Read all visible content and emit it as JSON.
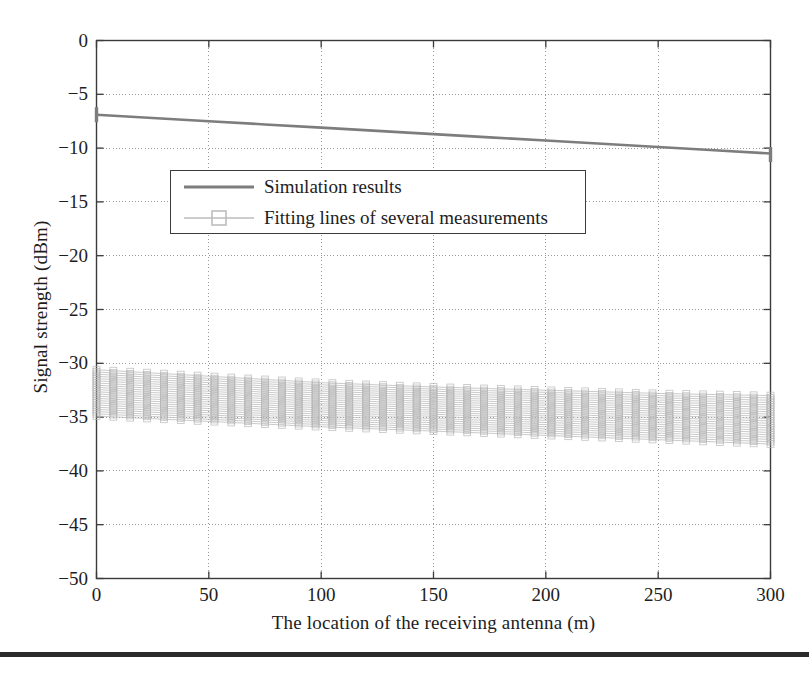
{
  "chart_data": {
    "type": "line",
    "title": "",
    "xlabel": "The location of the receiving antenna (m)",
    "ylabel": "Signal strength (dBm)",
    "xlim": [
      0,
      300
    ],
    "ylim": [
      -50,
      0
    ],
    "xticks": [
      0,
      50,
      100,
      150,
      200,
      250,
      300
    ],
    "yticks": [
      0,
      -5,
      -10,
      -15,
      -20,
      -25,
      -30,
      -35,
      -40,
      -45,
      -50
    ],
    "xtick_labels": [
      "0",
      "50",
      "100",
      "150",
      "200",
      "250",
      "300"
    ],
    "ytick_labels": [
      "0",
      "−5",
      "−10",
      "−15",
      "−20",
      "−25",
      "−30",
      "−35",
      "−40",
      "−45",
      "−50"
    ],
    "grid": true,
    "grid_style": "dotted",
    "legend_position": "upper-left-inset",
    "series": [
      {
        "name": "Simulation results",
        "style": "solid-line",
        "color": "#7d7d7d",
        "marker": "none",
        "x": [
          0,
          25,
          50,
          75,
          100,
          125,
          150,
          175,
          200,
          225,
          250,
          275,
          300
        ],
        "values": [
          -6.9,
          -7.2,
          -7.5,
          -7.8,
          -8.1,
          -8.4,
          -8.7,
          -9.0,
          -9.3,
          -9.6,
          -9.9,
          -10.2,
          -10.5
        ]
      },
      {
        "name": "Fitting lines of several measurements",
        "style": "line-with-square-markers",
        "color": "#b8b8b8",
        "marker": "square",
        "description": "A dense bundle of ~22 near-parallel fitting lines forming a band",
        "band_upper": {
          "x": [
            0,
            50,
            100,
            150,
            200,
            250,
            300
          ],
          "values": [
            -30.6,
            -31.2,
            -31.8,
            -32.2,
            -32.5,
            -32.8,
            -33.0
          ]
        },
        "band_lower": {
          "x": [
            0,
            50,
            100,
            150,
            200,
            250,
            300
          ],
          "values": [
            -34.9,
            -35.4,
            -35.9,
            -36.3,
            -36.7,
            -37.1,
            -37.5
          ]
        },
        "band_center": {
          "x": [
            0,
            50,
            100,
            150,
            200,
            250,
            300
          ],
          "values": [
            -32.7,
            -33.3,
            -33.8,
            -34.2,
            -34.6,
            -34.9,
            -35.2
          ]
        }
      }
    ]
  },
  "legend": {
    "entries": [
      {
        "label": "Simulation results",
        "sample": "solid-line-sample"
      },
      {
        "label": "Fitting lines of several measurements",
        "sample": "line-square-marker-sample"
      }
    ]
  },
  "colors": {
    "axis": "#3b3b3b",
    "grid": "#9a9a9a",
    "simulation_line": "#7d7d7d",
    "fitting_lines": "#b8b8b8",
    "text": "#1d1d1d",
    "footer_rule": "#2b2b2b",
    "background": "#ffffff"
  }
}
